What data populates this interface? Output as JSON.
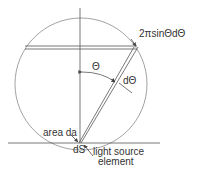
{
  "diagram": {
    "type": "geometry-illustration",
    "labels": {
      "ring_area": "2πsinΘdΘ",
      "angle": "Θ",
      "angle_increment": "dΘ",
      "area_element": "area da",
      "source_element_symbol": "dS",
      "source_line1": "light source",
      "source_line2": "element"
    },
    "colors": {
      "line": "#555555",
      "circle": "#888888",
      "text": "#333333",
      "background": "#ffffff"
    }
  }
}
